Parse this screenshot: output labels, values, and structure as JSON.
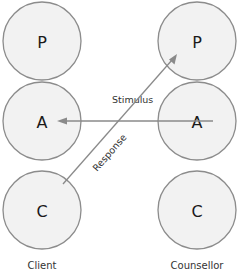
{
  "diagram": {
    "type": "transactional-analysis-crossed-transaction",
    "parties": [
      {
        "label": "Client",
        "ego_states": [
          {
            "letter": "P"
          },
          {
            "letter": "A"
          },
          {
            "letter": "C"
          }
        ]
      },
      {
        "label": "Counsellor",
        "ego_states": [
          {
            "letter": "P"
          },
          {
            "letter": "A"
          },
          {
            "letter": "C"
          }
        ]
      }
    ],
    "arrows": [
      {
        "label": "Stimulus",
        "from": "Counsellor.A",
        "to": "Client.A"
      },
      {
        "label": "Response",
        "from": "Client.C",
        "to": "Counsellor.P"
      }
    ]
  },
  "colors": {
    "circle_fill": "#f2f2f2",
    "circle_stroke": "#8c8c8c",
    "arrow": "#8a8a8a",
    "text": "#1a1a1a"
  }
}
